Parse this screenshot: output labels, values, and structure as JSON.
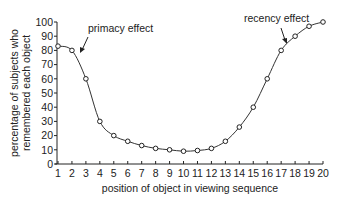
{
  "chart_data": {
    "type": "line",
    "title": "",
    "xlabel": "position of object in viewing sequence",
    "ylabel_lines": [
      "percentage of subjects who",
      "remembered each object"
    ],
    "ylabel": "percentage of subjects who remembered each object",
    "x": [
      1,
      2,
      3,
      4,
      5,
      6,
      7,
      8,
      9,
      10,
      11,
      12,
      13,
      14,
      15,
      16,
      17,
      18,
      19,
      20
    ],
    "values": [
      83,
      80,
      60,
      30,
      20,
      16,
      13,
      11,
      10,
      9,
      9.5,
      11,
      16,
      26,
      40,
      60,
      80,
      90,
      97,
      100
    ],
    "xlim": [
      1,
      20
    ],
    "ylim": [
      0,
      100
    ],
    "yticks": [
      0,
      10,
      20,
      30,
      40,
      50,
      60,
      70,
      80,
      90,
      100
    ],
    "xticks": [
      1,
      2,
      3,
      4,
      5,
      6,
      7,
      8,
      9,
      10,
      11,
      12,
      13,
      14,
      15,
      16,
      17,
      18,
      19,
      20
    ],
    "grid": false,
    "legend": null,
    "marker": "open-circle",
    "annotations": [
      {
        "text": "primacy effect",
        "points_to_x": 2.6
      },
      {
        "text": "recency effect",
        "points_to_x": 16.7
      }
    ]
  }
}
